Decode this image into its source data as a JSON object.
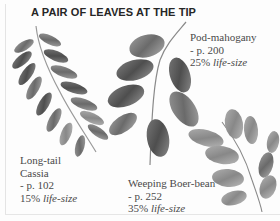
{
  "page": {
    "title": "A PAIR OF LEAVES AT THE TIP"
  },
  "specimens": [
    {
      "name_line1": "Pod-mahogany",
      "name_line2": "",
      "page_ref": "- p. 200",
      "scale_pct": "25%",
      "scale_label": "life-size",
      "illustration": "pod-mahogany-leaf-illustration"
    },
    {
      "name_line1": "Long-tail",
      "name_line2": "Cassia",
      "page_ref": "- p. 102",
      "scale_pct": "15%",
      "scale_label": "life-size",
      "illustration": "long-tail-cassia-leaf-illustration"
    },
    {
      "name_line1": "Weeping Boer-bean",
      "name_line2": "",
      "page_ref": "- p. 252",
      "scale_pct": "35%",
      "scale_label": "life-size",
      "illustration": "weeping-boer-bean-leaf-illustration"
    }
  ],
  "colors": {
    "text": "#4a4a4a",
    "title": "#262626",
    "leaf_dark": "#5a5a5a",
    "leaf_mid": "#8c8c8c",
    "leaf_light": "#b8b8b8",
    "background": "#fdfdfd"
  }
}
